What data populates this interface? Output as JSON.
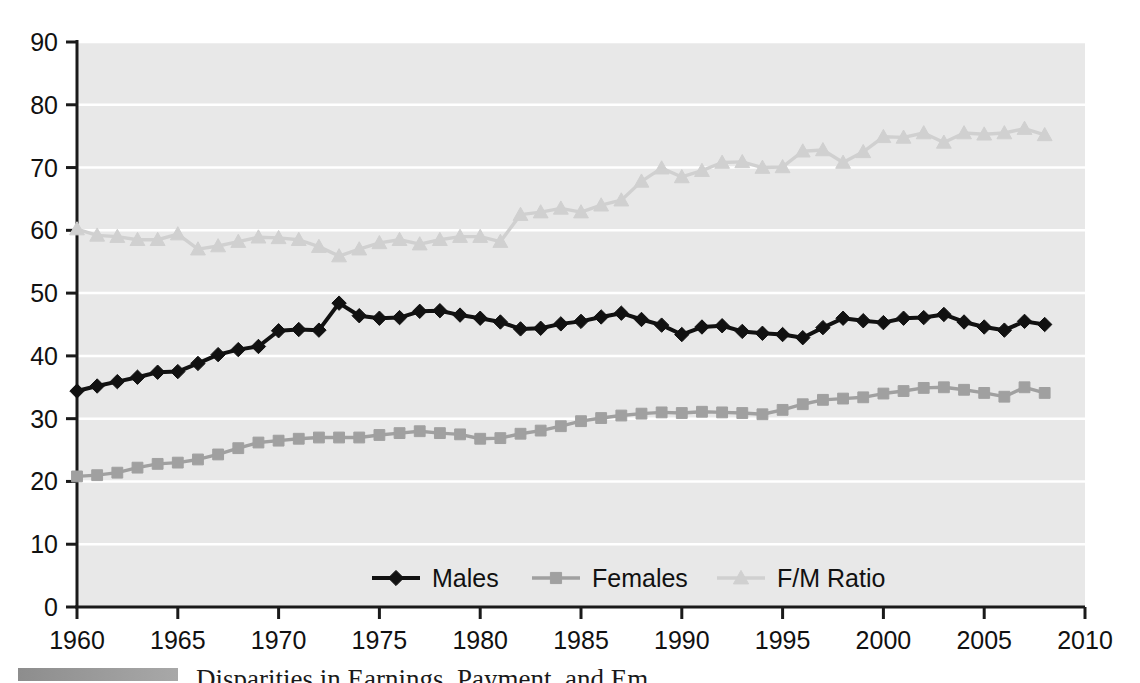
{
  "chart_data": {
    "type": "line",
    "title": "",
    "xlabel": "",
    "ylabel": "",
    "xlim": [
      1960,
      2010
    ],
    "ylim": [
      0,
      90
    ],
    "grid": true,
    "grid_orientation": "horizontal",
    "legend_position": "bottom-center",
    "plot_background": "#e8e8e8",
    "x": [
      1960,
      1961,
      1962,
      1963,
      1964,
      1965,
      1966,
      1967,
      1968,
      1969,
      1970,
      1971,
      1972,
      1973,
      1974,
      1975,
      1976,
      1977,
      1978,
      1979,
      1980,
      1981,
      1982,
      1983,
      1984,
      1985,
      1986,
      1987,
      1988,
      1989,
      1990,
      1991,
      1992,
      1993,
      1994,
      1995,
      1996,
      1997,
      1998,
      1999,
      2000,
      2001,
      2002,
      2003,
      2004,
      2005,
      2006,
      2007,
      2008
    ],
    "xticks": [
      1960,
      1965,
      1970,
      1975,
      1980,
      1985,
      1990,
      1995,
      2000,
      2005,
      2010
    ],
    "xtick_labels": [
      "1960",
      "1965",
      "1970",
      "1975",
      "1980",
      "1985",
      "1990",
      "1995",
      "2000",
      "2005",
      "2010"
    ],
    "yticks": [
      0,
      10,
      20,
      30,
      40,
      50,
      60,
      70,
      80,
      90
    ],
    "ytick_labels": [
      "0",
      "10",
      "20",
      "30",
      "40",
      "50",
      "60",
      "70",
      "80",
      "90"
    ],
    "series": [
      {
        "name": "Males",
        "color": "#111111",
        "marker": "diamond",
        "values": [
          34.4,
          35.2,
          35.9,
          36.6,
          37.4,
          37.5,
          38.8,
          40.2,
          41.0,
          41.5,
          44.0,
          44.2,
          44.1,
          48.4,
          46.4,
          46.0,
          46.1,
          47.1,
          47.2,
          46.5,
          46.0,
          45.4,
          44.3,
          44.4,
          45.1,
          45.5,
          46.2,
          46.8,
          45.8,
          44.9,
          43.4,
          44.6,
          44.8,
          43.9,
          43.6,
          43.4,
          42.9,
          44.5,
          46.0,
          45.6,
          45.3,
          46.0,
          46.1,
          46.6,
          45.4,
          44.6,
          44.1,
          45.5,
          45.0
        ]
      },
      {
        "name": "Females",
        "color": "#a0a0a0",
        "marker": "square",
        "values": [
          20.8,
          21.0,
          21.4,
          22.2,
          22.8,
          23.0,
          23.5,
          24.3,
          25.3,
          26.2,
          26.5,
          26.8,
          27.0,
          27.0,
          27.0,
          27.4,
          27.7,
          28.0,
          27.7,
          27.5,
          26.8,
          26.9,
          27.6,
          28.1,
          28.8,
          29.6,
          30.1,
          30.5,
          30.8,
          31.0,
          30.9,
          31.1,
          31.0,
          30.9,
          30.7,
          31.4,
          32.3,
          33.0,
          33.2,
          33.4,
          34.0,
          34.4,
          34.9,
          35.0,
          34.6,
          34.1,
          33.5,
          35.0,
          34.1
        ]
      },
      {
        "name": "F/M Ratio",
        "color": "#d0d0d0",
        "marker": "triangle",
        "values": [
          60.2,
          59.2,
          59.0,
          58.5,
          58.5,
          59.4,
          57.0,
          57.5,
          58.2,
          58.9,
          58.8,
          58.5,
          57.4,
          55.9,
          57.0,
          58.0,
          58.5,
          57.8,
          58.5,
          59.0,
          59.0,
          58.2,
          62.5,
          62.9,
          63.5,
          62.9,
          64.0,
          64.8,
          67.8,
          69.9,
          68.5,
          69.5,
          70.8,
          70.9,
          70.0,
          70.1,
          72.6,
          72.8,
          70.8,
          72.5,
          74.9,
          74.8,
          75.5,
          74.0,
          75.5,
          75.3,
          75.5,
          76.2,
          75.2
        ]
      }
    ],
    "legend": [
      {
        "label": "Males",
        "color": "#111111",
        "marker": "diamond"
      },
      {
        "label": "Females",
        "color": "#a0a0a0",
        "marker": "square"
      },
      {
        "label": "F/M Ratio",
        "color": "#d0d0d0",
        "marker": "triangle"
      }
    ]
  },
  "caption": {
    "text": "Disparities in Earnings, Payment, and Em"
  }
}
